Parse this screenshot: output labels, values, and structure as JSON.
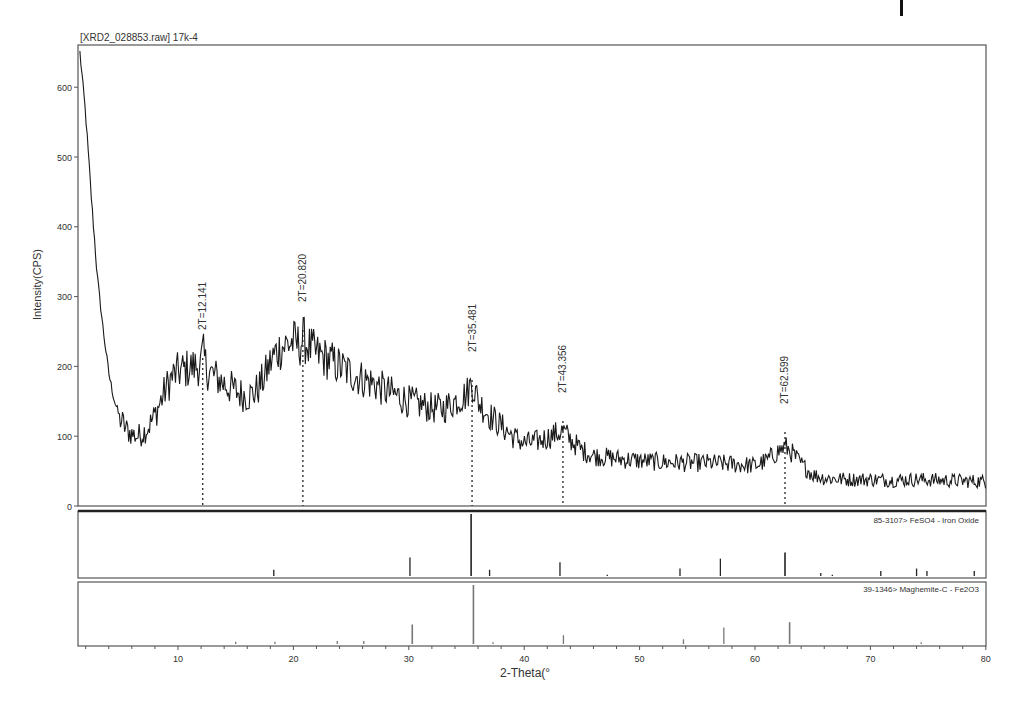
{
  "chart_data": {
    "type": "line",
    "title": "[XRD2_028853.raw] 17k-4",
    "xlabel": "2-Theta(°",
    "ylabel": "Intensity(CPS)",
    "xlim": [
      1.5,
      80
    ],
    "ylim": [
      0,
      660
    ],
    "x_ticks": [
      10,
      20,
      30,
      40,
      50,
      60,
      70,
      80
    ],
    "y_ticks": [
      0,
      100,
      200,
      300,
      400,
      500,
      600
    ],
    "grid": false,
    "legend": "none",
    "series": [
      {
        "name": "XRD2_028853 17k-4 spectrum",
        "x": [
          1.5,
          2.0,
          2.5,
          3.0,
          3.5,
          4.0,
          4.5,
          5.0,
          5.5,
          6.0,
          6.5,
          7.0,
          7.5,
          8.0,
          8.5,
          9.0,
          9.5,
          10.0,
          10.5,
          11.0,
          11.5,
          12.0,
          12.14,
          12.5,
          13.0,
          13.5,
          14.0,
          14.5,
          15.0,
          15.5,
          16.0,
          16.5,
          17.0,
          17.5,
          18.0,
          18.5,
          19.0,
          19.5,
          20.0,
          20.5,
          20.82,
          21.5,
          22.0,
          23.0,
          24.0,
          25.0,
          26.0,
          27.0,
          28.0,
          29.0,
          30.0,
          31.0,
          32.0,
          33.0,
          34.0,
          35.0,
          35.48,
          36.0,
          37.0,
          38.0,
          39.0,
          40.0,
          41.0,
          42.0,
          43.0,
          43.36,
          44.0,
          45.0,
          46.0,
          48.0,
          50.0,
          52.0,
          54.0,
          56.0,
          58.0,
          60.0,
          61.0,
          62.0,
          62.6,
          63.0,
          64.0,
          65.0,
          66.0,
          68.0,
          70.0,
          72.0,
          74.0,
          76.0,
          78.0,
          80.0
        ],
        "y": [
          650,
          560,
          440,
          330,
          255,
          190,
          150,
          125,
          110,
          103,
          100,
          105,
          115,
          130,
          150,
          170,
          185,
          192,
          195,
          198,
          200,
          202,
          220,
          195,
          188,
          182,
          175,
          170,
          165,
          160,
          158,
          160,
          170,
          185,
          205,
          220,
          228,
          232,
          235,
          230,
          240,
          225,
          218,
          210,
          200,
          190,
          182,
          175,
          165,
          158,
          150,
          145,
          140,
          140,
          150,
          160,
          178,
          150,
          130,
          115,
          100,
          90,
          92,
          98,
          105,
          108,
          95,
          80,
          72,
          68,
          65,
          63,
          62,
          62,
          60,
          58,
          65,
          78,
          85,
          80,
          60,
          45,
          40,
          38,
          38,
          37,
          38,
          37,
          36,
          35
        ]
      }
    ],
    "annotations": [
      {
        "label": "2T=12.141",
        "x": 12.141
      },
      {
        "label": "2T=20.820",
        "x": 20.82
      },
      {
        "label": "2T=35.481",
        "x": 35.481
      },
      {
        "label": "2T=43.356",
        "x": 43.356
      },
      {
        "label": "2T=62.599",
        "x": 62.599
      }
    ],
    "reference_patterns": [
      {
        "label": "85-3107> FeSO4 - Iron Oxide",
        "peaks": [
          {
            "x": 18.3,
            "rel": 0.1
          },
          {
            "x": 30.1,
            "rel": 0.3
          },
          {
            "x": 35.4,
            "rel": 1.0
          },
          {
            "x": 37.0,
            "rel": 0.1
          },
          {
            "x": 43.1,
            "rel": 0.22
          },
          {
            "x": 47.2,
            "rel": 0.02
          },
          {
            "x": 53.5,
            "rel": 0.12
          },
          {
            "x": 57.0,
            "rel": 0.28
          },
          {
            "x": 62.6,
            "rel": 0.38
          },
          {
            "x": 65.7,
            "rel": 0.05
          },
          {
            "x": 66.7,
            "rel": 0.02
          },
          {
            "x": 70.9,
            "rel": 0.08
          },
          {
            "x": 74.0,
            "rel": 0.12
          },
          {
            "x": 74.9,
            "rel": 0.08
          },
          {
            "x": 79.0,
            "rel": 0.08
          }
        ]
      },
      {
        "label": "39-1346> Maghemite-C - Fe2O3",
        "peaks": [
          {
            "x": 15.0,
            "rel": 0.04
          },
          {
            "x": 18.4,
            "rel": 0.04
          },
          {
            "x": 23.8,
            "rel": 0.05
          },
          {
            "x": 26.1,
            "rel": 0.05
          },
          {
            "x": 30.3,
            "rel": 0.33
          },
          {
            "x": 35.6,
            "rel": 1.0
          },
          {
            "x": 37.3,
            "rel": 0.03
          },
          {
            "x": 43.4,
            "rel": 0.15
          },
          {
            "x": 53.8,
            "rel": 0.08
          },
          {
            "x": 57.3,
            "rel": 0.28
          },
          {
            "x": 63.0,
            "rel": 0.37
          },
          {
            "x": 74.4,
            "rel": 0.03
          }
        ]
      }
    ]
  },
  "labels": {
    "plot_title": "[XRD2_028853.raw] 17k-4",
    "y_axis_label": "Intensity(CPS)",
    "x_axis_label": "2-Theta(°",
    "ref1_label": "85-3107> FeSO4 - Iron Oxide",
    "ref2_label": "39-1346> Maghemite-C - Fe2O3"
  },
  "colors": {
    "spectrum": "#1a1a1a",
    "axis": "#555555",
    "ref_stick": "#222222",
    "ref2_stick": "#777777"
  }
}
